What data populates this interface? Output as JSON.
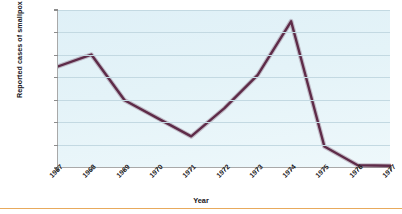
{
  "chart_data": {
    "type": "line",
    "title": "",
    "xlabel": "Year",
    "ylabel": "Reported cases of smallpox in the world",
    "categories": [
      "1967",
      "1968",
      "1969",
      "1970",
      "1971",
      "1972",
      "1973",
      "1974",
      "1975",
      "1976",
      "1977"
    ],
    "values": [
      9000,
      10050,
      6000,
      4400,
      2800,
      5300,
      8250,
      13000,
      1900,
      250,
      200
    ],
    "series": [
      {
        "name": "Reported cases of smallpox in the world",
        "values": [
          9000,
          10050,
          6000,
          4400,
          2800,
          5300,
          8250,
          13000,
          1900,
          250,
          200
        ],
        "color": "#5e2b48"
      }
    ],
    "ylim": [
      0,
      14000
    ],
    "y_ticks": [
      0,
      2000,
      4000,
      6000,
      8000,
      10000,
      12000,
      14000
    ],
    "y_tick_labels": [
      "0",
      "2,000",
      "4,000",
      "6,000",
      "8,000",
      "10,000",
      "12,000",
      "14,000"
    ],
    "x_ticks": [
      "1967",
      "1968",
      "1969",
      "1970",
      "1971",
      "1972",
      "1973",
      "1974",
      "1975",
      "1976",
      "1977"
    ],
    "grid": true,
    "legend": "none",
    "plot_background": "#e4f3f8",
    "line_color": "#5e2b48",
    "accent_rule_color": "#e8aa5c"
  }
}
